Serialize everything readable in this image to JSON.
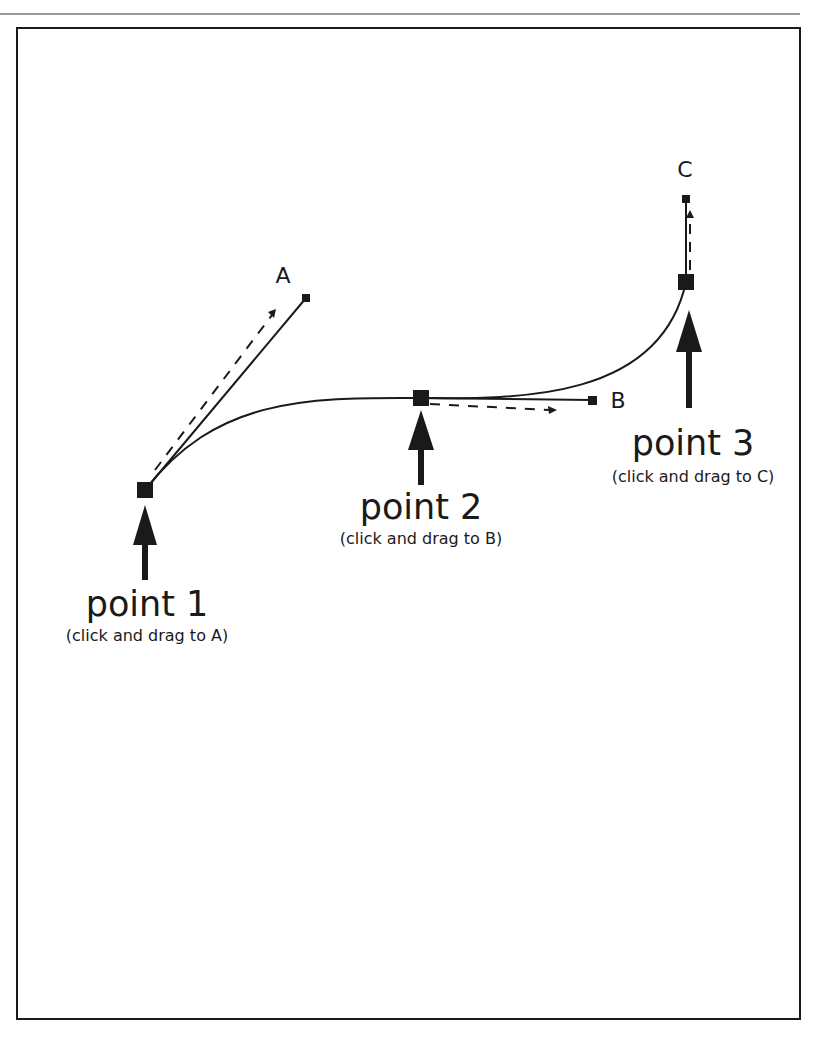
{
  "diagram": {
    "type": "bezier-pen-tool-instructions",
    "colors": {
      "stroke": "#1a1a1a",
      "frame": "#1a1a1a",
      "rule": "#9a9a9a",
      "background": "#ffffff"
    },
    "points": [
      {
        "id": "point-1",
        "title": "point 1",
        "instruction": "(click and drag to A)",
        "handle_label": "A"
      },
      {
        "id": "point-2",
        "title": "point 2",
        "instruction": "(click and drag to B)",
        "handle_label": "B"
      },
      {
        "id": "point-3",
        "title": "point 3",
        "instruction": "(click and drag to C)",
        "handle_label": "C"
      }
    ]
  }
}
